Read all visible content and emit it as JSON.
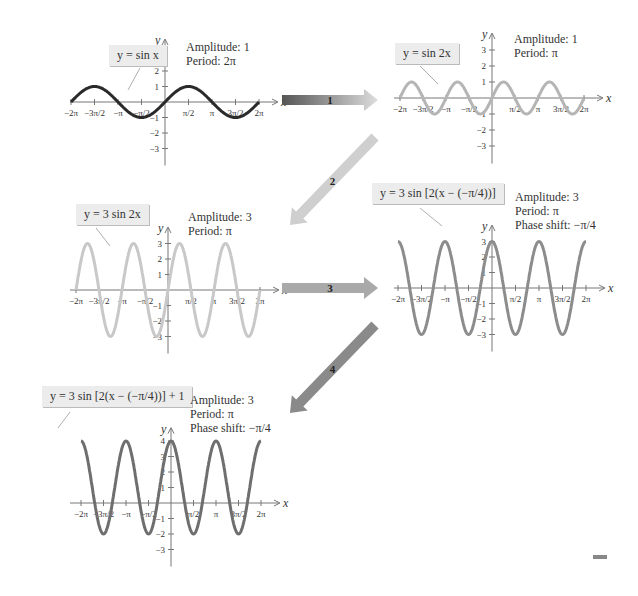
{
  "panels": [
    {
      "id": "p1",
      "equation": "y = sin x",
      "amplitude": "Amplitude: 1",
      "period": "Period: 2π",
      "phase": "",
      "color": "#2a2a2a"
    },
    {
      "id": "p2",
      "equation": "y = sin 2x",
      "amplitude": "Amplitude: 1",
      "period": "Period: π",
      "phase": "",
      "color": "#b5b5b5"
    },
    {
      "id": "p3",
      "equation": "y = 3 sin 2x",
      "amplitude": "Amplitude: 3",
      "period": "Period: π",
      "phase": "",
      "color": "#c8c8c8"
    },
    {
      "id": "p4",
      "equation": "y = 3 sin [2(x − (−π/4))]",
      "amplitude": "Amplitude: 3",
      "period": "Period: π",
      "phase": "Phase shift: −π/4",
      "color": "#8c8c8c"
    },
    {
      "id": "p5",
      "equation": "y = 3 sin [2(x − (−π/4))] + 1",
      "amplitude": "Amplitude: 3",
      "period": "Period: π",
      "phase": "Phase shift: −π/4",
      "color": "#6e6e6e"
    }
  ],
  "arrows": [
    {
      "label": "1"
    },
    {
      "label": "2"
    },
    {
      "label": "3"
    },
    {
      "label": "4"
    }
  ],
  "axis": {
    "x_label": "x",
    "y_label": "y",
    "x_ticks": [
      "−2π",
      "−3π/2",
      "−π",
      "−π/2",
      "π/2",
      "π",
      "3π/2",
      "2π"
    ]
  },
  "chart_data": [
    {
      "type": "line",
      "title": "y = sin x",
      "function": "sin(x)",
      "xlim": [
        "-2π",
        "2π"
      ],
      "ylim": [
        -3,
        3
      ],
      "amplitude": 1,
      "period": "2π"
    },
    {
      "type": "line",
      "title": "y = sin 2x",
      "function": "sin(2x)",
      "xlim": [
        "-2π",
        "2π"
      ],
      "ylim": [
        -3,
        3
      ],
      "amplitude": 1,
      "period": "π"
    },
    {
      "type": "line",
      "title": "y = 3 sin 2x",
      "function": "3sin(2x)",
      "xlim": [
        "-2π",
        "2π"
      ],
      "ylim": [
        -3,
        3
      ],
      "amplitude": 3,
      "period": "π"
    },
    {
      "type": "line",
      "title": "y = 3 sin [2(x − (−π/4))]",
      "function": "3sin(2(x+π/4))",
      "xlim": [
        "-2π",
        "2π"
      ],
      "ylim": [
        -3,
        3
      ],
      "amplitude": 3,
      "period": "π",
      "phase_shift": "−π/4"
    },
    {
      "type": "line",
      "title": "y = 3 sin [2(x − (−π/4))] + 1",
      "function": "3sin(2(x+π/4))+1",
      "xlim": [
        "-2π",
        "2π"
      ],
      "ylim": [
        -3,
        4
      ],
      "amplitude": 3,
      "period": "π",
      "phase_shift": "−π/4",
      "vertical_shift": 1
    }
  ]
}
